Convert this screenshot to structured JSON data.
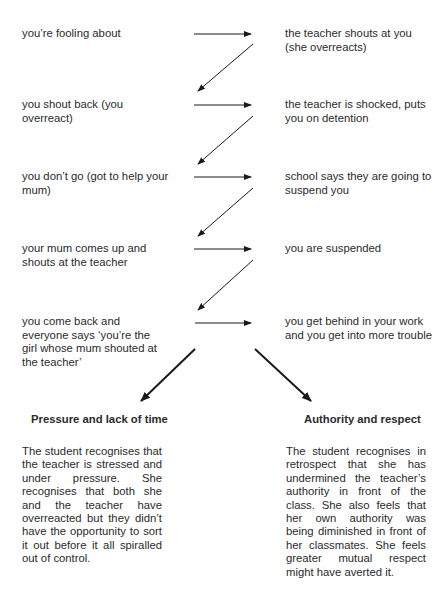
{
  "diagram": {
    "type": "flowchart",
    "steps": [
      {
        "left": "you’re fooling about",
        "right": "the teacher shouts at you (she overreacts)"
      },
      {
        "left": "you shout back (you overreact)",
        "right": "the teacher is shocked, puts you on detention"
      },
      {
        "left": "you don’t go (got to help your mum)",
        "right": "school says they are going to suspend you"
      },
      {
        "left": "your mum comes up and shouts at the teacher",
        "right": "you are suspended"
      },
      {
        "left": "you come back and everyone says ‘you’re the girl whose mum shouted at the teacher’",
        "right": "you get behind in your work and you get into more trouble"
      }
    ],
    "outcomes": [
      {
        "heading": "Pressure and lack of time",
        "text": "The student recognises that the teacher is stressed and under pressure. She recognises that both she and the teacher have overreacted but they didn’t have the opportunity to sort it out before it all spiralled out of control."
      },
      {
        "heading": "Authority and respect",
        "text": "The student recognises in retrospect that she has undermined the teacher’s authority in front of the class. She also feels that her own authority was being diminished in front of her classmates. She feels greater mutual respect might have averted it."
      }
    ],
    "colors": {
      "text": "#2b2b2b",
      "arrow": "#1a1a1a",
      "background": "#ffffff"
    }
  }
}
